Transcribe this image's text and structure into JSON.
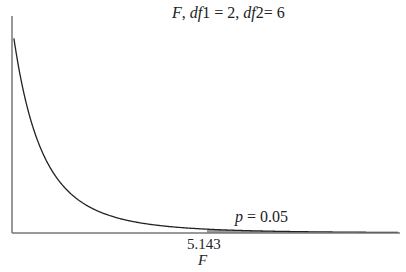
{
  "chart_data": {
    "type": "line",
    "distribution": "F",
    "df1": 2,
    "df2": 6,
    "xlabel": "F",
    "ylabel": "",
    "critical_value": 5.143,
    "critical_label": "5.143",
    "alpha_label": "p = 0.05",
    "alpha": 0.05,
    "xlim": [
      0,
      10.2
    ],
    "ylim": [
      0,
      1.05
    ],
    "grid": false,
    "shaded_region": "right tail beyond 5.143"
  },
  "labels": {
    "title_F": "F",
    "title_rest_1": ", ",
    "title_df1": "df",
    "title_df1_val": "1 = 2, ",
    "title_df2": "df",
    "title_df2_val": "2= 6",
    "p_sym": "p",
    "p_val": " = 0.05",
    "critical": "5.143",
    "xlabel": "F"
  },
  "colors": {
    "curve": "#222222",
    "axis": "#777777",
    "shade": "#9a9a9a"
  }
}
